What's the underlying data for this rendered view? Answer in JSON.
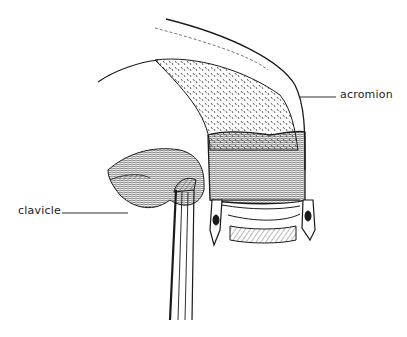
{
  "figure": {
    "type": "anatomical line illustration",
    "labels": [
      {
        "id": "acromion",
        "text": "acromion",
        "leader_to": [
          300,
          96
        ]
      },
      {
        "id": "clavicle",
        "text": "clavicle",
        "leader_to": [
          130,
          213
        ]
      }
    ],
    "colors": {
      "ink": "#1a1a1a",
      "background": "#ffffff"
    }
  }
}
